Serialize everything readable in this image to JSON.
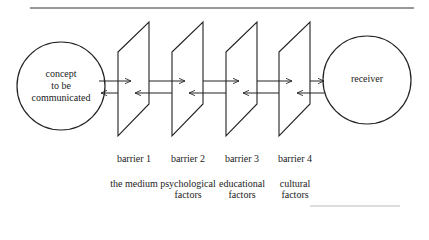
{
  "diagram": {
    "type": "communication-barriers",
    "sender": {
      "label_lines": [
        "concept",
        "to be",
        "communicated"
      ]
    },
    "receiver": {
      "label": "receiver"
    },
    "barriers": [
      {
        "name": "barrier 1",
        "description_lines": [
          "the medium"
        ]
      },
      {
        "name": "barrier 2",
        "description_lines": [
          "psychological",
          "factors"
        ]
      },
      {
        "name": "barrier 3",
        "description_lines": [
          "educational",
          "factors"
        ]
      },
      {
        "name": "barrier 4",
        "description_lines": [
          "cultural",
          "factors"
        ]
      }
    ],
    "flows": [
      {
        "direction": "forward",
        "from": "concept to be communicated",
        "to": "receiver"
      },
      {
        "direction": "backward",
        "from": "receiver",
        "to": "concept to be communicated"
      }
    ]
  }
}
